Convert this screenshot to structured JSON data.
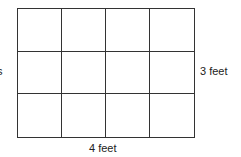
{
  "diagram": {
    "grid": {
      "rows": 3,
      "columns": 4,
      "line_color": "#333333"
    },
    "labels": {
      "height": "3 feet",
      "width": "4 feet",
      "left_fragment": "s"
    }
  }
}
